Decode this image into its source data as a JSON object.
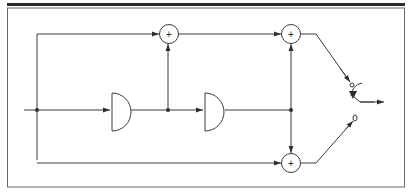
{
  "diagram": {
    "type": "signal-flow block diagram",
    "colors": {
      "stroke": "#3a3a3a",
      "frame": "#6a6a6a",
      "top_bar": "#2a2a2a",
      "background": "#ffffff"
    },
    "adders": [
      {
        "id": "adder-top-left",
        "symbol": "+"
      },
      {
        "id": "adder-top-right",
        "symbol": "+"
      },
      {
        "id": "adder-bottom",
        "symbol": "+"
      }
    ],
    "delays": [
      {
        "id": "delay-1"
      },
      {
        "id": "delay-2"
      }
    ],
    "junctions": 3,
    "switch": {
      "id": "output-switch",
      "positions": 2
    }
  }
}
